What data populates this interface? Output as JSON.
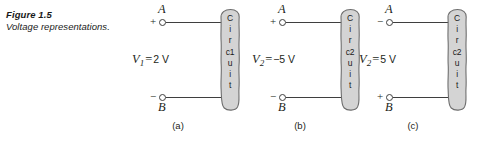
{
  "figure": {
    "title": "Figure 1.5",
    "subtitle": "Voltage representations."
  },
  "colors": {
    "blob_fill": "#d4d4d4",
    "blob_stroke": "#6e6e6e",
    "wire": "#3f3f3f",
    "text": "#231f20"
  },
  "panels": [
    {
      "id": "a",
      "sub_label": "(a)",
      "top_terminal": {
        "sign": "+",
        "node": "A"
      },
      "bottom_terminal": {
        "sign": "−",
        "node": "B"
      },
      "voltage": {
        "symbol": "V",
        "subscript": "1",
        "equals": "=",
        "value": "2 V",
        "full": "V1 = 2 V"
      },
      "circuit": {
        "name": "Circuit 1",
        "stack": [
          "C",
          "i",
          "r",
          "c1",
          "u",
          "i",
          "t"
        ]
      }
    },
    {
      "id": "b",
      "sub_label": "(b)",
      "top_terminal": {
        "sign": "+",
        "node": "A"
      },
      "bottom_terminal": {
        "sign": "−",
        "node": "B"
      },
      "voltage": {
        "symbol": "V",
        "subscript": "2",
        "equals": "=",
        "value": "−5 V",
        "full": "V2 = −5 V"
      },
      "circuit": {
        "name": "Circuit 2",
        "stack": [
          "C",
          "i",
          "r",
          "c2",
          "u",
          "i",
          "t"
        ]
      }
    },
    {
      "id": "c",
      "sub_label": "(c)",
      "top_terminal": {
        "sign": "−",
        "node": "A"
      },
      "bottom_terminal": {
        "sign": "+",
        "node": "B"
      },
      "voltage": {
        "symbol": "V",
        "subscript": "2",
        "equals": "=",
        "value": "5 V",
        "full": "V2 = 5 V"
      },
      "circuit": {
        "name": "Circuit 2",
        "stack": [
          "C",
          "i",
          "r",
          "c2",
          "u",
          "i",
          "t"
        ]
      }
    }
  ]
}
